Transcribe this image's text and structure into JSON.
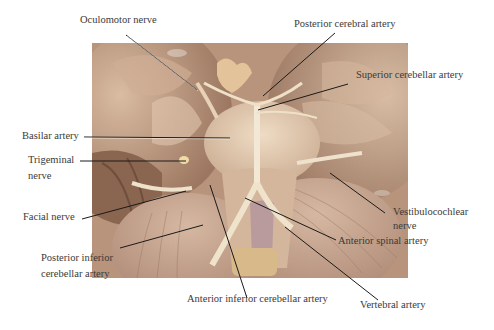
{
  "figure": {
    "type": "anatomical photograph with labels",
    "colors": {
      "background": "#ffffff",
      "tissue_main": "#c9a98e",
      "tissue_dark": "#8e6a52",
      "tissue_light": "#e6d2ba",
      "vessel": "#f1e6d2",
      "label_text": "#3a3a3a",
      "leader_line": "#1a1a1a"
    }
  },
  "labels": {
    "oculomotor": "Oculomotor nerve",
    "posterior_cerebral": "Posterior cerebral artery",
    "superior_cerebellar": "Superior cerebellar artery",
    "basilar": "Basilar artery",
    "trigeminal_1": "Trigeminal",
    "trigeminal_2": "nerve",
    "facial": "Facial nerve",
    "pica_1": "Posterior inferior",
    "pica_2": "cerebellar artery",
    "vestibulocochlear_1": "Vestibulocochlear",
    "vestibulocochlear_2": "nerve",
    "anterior_spinal": "Anterior spinal artery",
    "aica": "Anterior inferior cerebellar artery",
    "vertebral": "Vertebral artery"
  }
}
